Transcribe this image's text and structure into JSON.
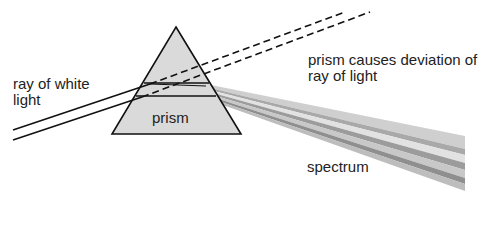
{
  "diagram": {
    "labels": {
      "ray": "ray of white light",
      "prism": "prism",
      "deviation": "prism causes deviation of ray of light",
      "spectrum": "spectrum"
    },
    "colors": {
      "prism_fill": "#dadada",
      "outline": "#111111",
      "spectrum_bands": [
        "#cfcfcf",
        "#a9a9a9",
        "#e0e0e0",
        "#9c9c9c",
        "#c4c4c4",
        "#8f8f8f",
        "#bdbdbd"
      ]
    }
  }
}
